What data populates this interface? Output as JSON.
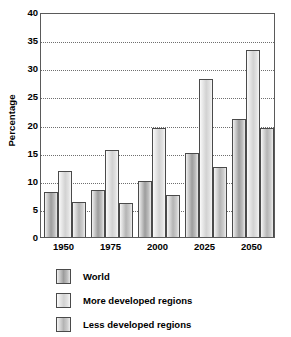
{
  "chart_data": {
    "type": "bar",
    "title": "",
    "xlabel": "",
    "ylabel": "Percentage",
    "categories": [
      "1950",
      "1975",
      "2000",
      "2025",
      "2050"
    ],
    "series": [
      {
        "name": "World",
        "values": [
          8.0,
          8.4,
          10.0,
          15.0,
          21.0
        ]
      },
      {
        "name": "More developed regions",
        "values": [
          11.7,
          15.4,
          19.4,
          28.1,
          33.3
        ]
      },
      {
        "name": "Less developed regions",
        "values": [
          6.2,
          6.1,
          7.5,
          12.4,
          19.3
        ]
      }
    ],
    "ylim": [
      0,
      40
    ],
    "ytick_values": [
      0,
      5,
      10,
      15,
      20,
      25,
      30,
      35,
      40
    ],
    "ytick_labels": [
      "0",
      "5",
      "10",
      "15",
      "20",
      "25",
      "30",
      "35",
      "40"
    ],
    "grid": true,
    "grid_axis": "y",
    "grid_style": "dotted",
    "legend_position": "below",
    "frame": true,
    "colors": {
      "series_0": "#9d9d9d",
      "series_1": "#d2d2d2",
      "series_2": "#b4b4b4",
      "bar_outline": "#4a4a4a",
      "gridline": "#6f6f6f",
      "frame": "#5a5a5a",
      "text": "#000000",
      "background": "#ffffff"
    }
  },
  "legend": {
    "items": [
      {
        "label": "World"
      },
      {
        "label": "More developed regions"
      },
      {
        "label": "Less developed regions"
      }
    ]
  }
}
